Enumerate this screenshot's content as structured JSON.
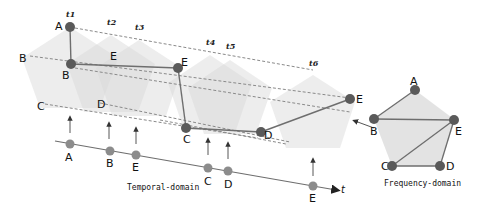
{
  "colors": {
    "pentagon_fill": "#dcdcdc",
    "node_dark": "#5a5a5a",
    "node_light": "#8c8c8c",
    "edge": "#6e6e6e",
    "dashed": "#8a8a8a"
  },
  "time_labels": [
    "t1",
    "t2",
    "t3",
    "t4",
    "t5",
    "t6"
  ],
  "temporal_graph": {
    "nodes": [
      {
        "id": "A",
        "label": "A"
      },
      {
        "id": "B",
        "label": "B"
      },
      {
        "id": "E1",
        "label": "E"
      },
      {
        "id": "C",
        "label": "C"
      },
      {
        "id": "D",
        "label": "D"
      },
      {
        "id": "E2",
        "label": "E"
      }
    ],
    "edges": [
      [
        "A",
        "B"
      ],
      [
        "B",
        "E1"
      ],
      [
        "E1",
        "C"
      ],
      [
        "C",
        "D"
      ],
      [
        "D",
        "E2"
      ]
    ],
    "lane_labels": {
      "B": "B",
      "C": "C",
      "D": "D",
      "E": "E"
    }
  },
  "timeline": {
    "axis_label": "t",
    "events": [
      "A",
      "B",
      "E",
      "C",
      "D",
      "E"
    ],
    "caption": "Temporal-domain"
  },
  "frequency_graph": {
    "nodes": [
      {
        "id": "A",
        "label": "A"
      },
      {
        "id": "B",
        "label": "B"
      },
      {
        "id": "E",
        "label": "E"
      },
      {
        "id": "C",
        "label": "C"
      },
      {
        "id": "D",
        "label": "D"
      }
    ],
    "edges": [
      [
        "A",
        "B"
      ],
      [
        "B",
        "E"
      ],
      [
        "E",
        "C"
      ],
      [
        "E",
        "D"
      ],
      [
        "C",
        "D"
      ]
    ],
    "caption": "Frequency-domain"
  }
}
